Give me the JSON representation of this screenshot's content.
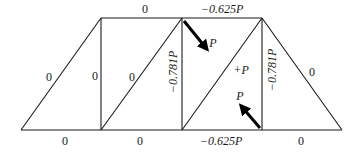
{
  "diagram": {
    "type": "truss",
    "nodes": {
      "bottom": [
        [
          21,
          130
        ],
        [
          101,
          130
        ],
        [
          182,
          130
        ],
        [
          262,
          130
        ],
        [
          342,
          130
        ]
      ],
      "top": [
        [
          101,
          18
        ],
        [
          182,
          18
        ],
        [
          262,
          18
        ]
      ]
    },
    "member_forces": {
      "top_chord_left": "0",
      "top_chord_right": "−0.625P",
      "bottom_chord_1": "0",
      "bottom_chord_2": "0",
      "bottom_chord_3": "−0.625P",
      "bottom_chord_4": "0",
      "left_end_diagonal": "0",
      "vertical_1": "0",
      "diagonal_2": "0",
      "vertical_2": "−0.781P",
      "diagonal_3": "+P",
      "vertical_3": "−0.781P",
      "right_end_diagonal": "0"
    },
    "loads": {
      "top_load_label": "P",
      "bottom_load_label": "P"
    }
  }
}
